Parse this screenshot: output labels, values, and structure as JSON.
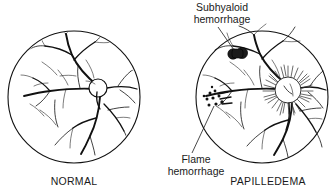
{
  "figure": {
    "type": "medical-illustration",
    "background_color": "#ffffff",
    "ink_color": "#111111"
  },
  "panels": [
    {
      "id": "normal",
      "caption": "NORMAL",
      "center": {
        "x": 74,
        "y": 97
      },
      "radius": 66,
      "disc": {
        "type": "optic-disc-normal",
        "center": {
          "x": 98,
          "y": 88
        },
        "radius": 9,
        "margin": "sharp"
      }
    },
    {
      "id": "papilledema",
      "caption": "PAPILLEDEMA",
      "center": {
        "x": 262,
        "y": 97
      },
      "radius": 66,
      "disc": {
        "type": "optic-disc-swollen",
        "center": {
          "x": 288,
          "y": 88
        },
        "radius": 11,
        "margin": "blurred",
        "ray_count": 46
      }
    }
  ],
  "annotations": [
    {
      "id": "subhyaloid",
      "line1": "Subhyaloid",
      "line2": "hemorrhage",
      "text_x": 222,
      "text_y1": 11,
      "text_y2": 23,
      "leader": {
        "x1": 218,
        "y1": 27,
        "x2": 234,
        "y2": 52
      },
      "marker": "dark-confluent-blobs"
    },
    {
      "id": "flame",
      "line1": "Flame",
      "line2": "hemorrhage",
      "text_x": 196,
      "text_y1": 163,
      "text_y2": 175,
      "leader": {
        "x1": 196,
        "y1": 152,
        "x2": 216,
        "y2": 104
      },
      "marker": "scattered-dots"
    }
  ],
  "lesions": {
    "subhyaloid_blobs": [
      {
        "cx": 233,
        "cy": 54,
        "r": 5.2
      },
      {
        "cx": 242,
        "cy": 53,
        "r": 5.6
      }
    ],
    "flame_dots": [
      {
        "cx": 210,
        "cy": 93,
        "r": 1.5
      },
      {
        "cx": 215,
        "cy": 91,
        "r": 1.4
      },
      {
        "cx": 207,
        "cy": 99,
        "r": 1.5
      },
      {
        "cx": 213,
        "cy": 98,
        "r": 1.6
      },
      {
        "cx": 219,
        "cy": 96,
        "r": 1.5
      },
      {
        "cx": 209,
        "cy": 105,
        "r": 1.5
      },
      {
        "cx": 216,
        "cy": 104,
        "r": 1.6
      },
      {
        "cx": 222,
        "cy": 102,
        "r": 1.7
      },
      {
        "cx": 204,
        "cy": 96,
        "r": 1.3
      },
      {
        "cx": 212,
        "cy": 87,
        "r": 1.2
      }
    ],
    "flame_streaks": [
      {
        "x1": 218,
        "y1": 94,
        "x2": 228,
        "y2": 92
      },
      {
        "x1": 220,
        "y1": 99,
        "x2": 231,
        "y2": 97
      },
      {
        "x1": 222,
        "y1": 104,
        "x2": 232,
        "y2": 103
      }
    ]
  }
}
